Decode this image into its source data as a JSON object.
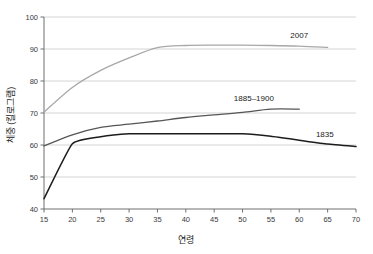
{
  "chart_data": {
    "type": "line",
    "title": "",
    "xlabel": "연령",
    "ylabel": "체중 (킬로그램)",
    "xlim": [
      15,
      70
    ],
    "ylim": [
      40,
      100
    ],
    "xticks": [
      15,
      20,
      25,
      30,
      35,
      40,
      45,
      50,
      55,
      60,
      65,
      70
    ],
    "yticks": [
      40,
      50,
      60,
      70,
      80,
      90,
      100
    ],
    "grid": "horizontal",
    "legend_position": "inline-end-of-line",
    "series": [
      {
        "name": "2007",
        "color": "#a8a8a8",
        "label_x": 60,
        "label_y": 93.4,
        "x": [
          15,
          20,
          25,
          30,
          35,
          40,
          45,
          50,
          55,
          60,
          65
        ],
        "values": [
          70.3,
          78.0,
          83.3,
          87.2,
          90.4,
          91.1,
          91.2,
          91.2,
          91.1,
          90.9,
          90.5
        ]
      },
      {
        "name": "1885–1900",
        "color": "#565656",
        "label_x": 52,
        "label_y": 73.6,
        "x": [
          15,
          20,
          25,
          30,
          35,
          40,
          45,
          50,
          55,
          60
        ],
        "values": [
          59.7,
          63.2,
          65.5,
          66.5,
          67.5,
          68.6,
          69.4,
          70.2,
          71.2,
          71.2
        ]
      },
      {
        "name": "1835",
        "color": "#1c1c1c",
        "label_x": 64.5,
        "label_y": 62.6,
        "x": [
          15,
          20,
          25,
          30,
          35,
          40,
          45,
          50,
          55,
          60,
          65,
          70
        ],
        "values": [
          43.2,
          60.4,
          62.6,
          63.5,
          63.5,
          63.5,
          63.5,
          63.5,
          62.7,
          61.5,
          60.3,
          59.5
        ]
      }
    ]
  },
  "axes": {
    "x_title": "연령",
    "y_title": "체중 (킬로그램)",
    "x_tick_labels": [
      "15",
      "20",
      "25",
      "30",
      "35",
      "40",
      "45",
      "50",
      "55",
      "60",
      "65",
      "70"
    ],
    "y_tick_labels": [
      "40",
      "50",
      "60",
      "70",
      "80",
      "90",
      "100"
    ]
  },
  "colors": {
    "axis": "#6e6e6e",
    "grid": "#c9c9c9",
    "text": "#2b2b2b",
    "series_2007": "#a8a8a8",
    "series_1885_1900": "#565656",
    "series_1835": "#1c1c1c",
    "background": "#ffffff"
  }
}
